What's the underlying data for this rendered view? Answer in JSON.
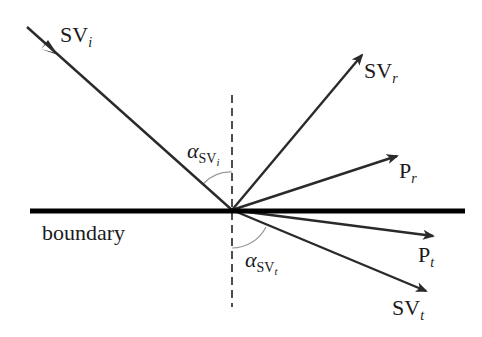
{
  "diagram": {
    "type": "wave-reflection-transmission",
    "boundary": {
      "label": "boundary"
    },
    "normal": {
      "style": "dashed"
    },
    "rays": [
      {
        "id": "incident",
        "label_main": "SV",
        "label_sub": "i"
      },
      {
        "id": "reflected-sv",
        "label_main": "SV",
        "label_sub": "r"
      },
      {
        "id": "reflected-p",
        "label_main": "P",
        "label_sub": "r"
      },
      {
        "id": "transmitted-p",
        "label_main": "P",
        "label_sub": "t"
      },
      {
        "id": "transmitted-sv",
        "label_main": "SV",
        "label_sub": "t"
      }
    ],
    "angles": [
      {
        "id": "incidence-angle",
        "symbol": "α",
        "sub_main": "SV",
        "sub_sub": "i"
      },
      {
        "id": "transmission-angle",
        "symbol": "α",
        "sub_main": "SV",
        "sub_sub": "t"
      }
    ],
    "colors": {
      "ray": "#2a2a2a",
      "boundary": "#000000",
      "arc": "#9a9a9a"
    }
  }
}
